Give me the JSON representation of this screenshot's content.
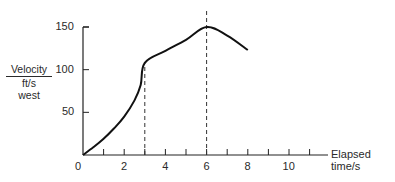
{
  "chart_data": {
    "type": "line",
    "title": "",
    "xlabel": "Elapsed time/s",
    "ylabel": [
      "Velocity",
      "ft/s",
      "west"
    ],
    "xlim": [
      0,
      11.5
    ],
    "ylim": [
      0,
      150
    ],
    "x_ticks": [
      "0",
      "2",
      "4",
      "6",
      "8",
      "10"
    ],
    "y_ticks": [
      "50",
      "100",
      "150"
    ],
    "grid": false,
    "legend": null,
    "series": [
      {
        "name": "Velocity",
        "x": [
          0,
          0.5,
          1,
          1.5,
          2,
          2.5,
          2.8,
          3,
          4,
          5,
          6,
          7,
          8
        ],
        "y": [
          0,
          9,
          19,
          31,
          45,
          64,
          82,
          108,
          122,
          135,
          150,
          140,
          123
        ]
      }
    ],
    "annotations": [
      {
        "type": "vline",
        "x": 3,
        "style": "dashed",
        "from_y": 0,
        "to_y": 108
      },
      {
        "type": "vline",
        "x": 6,
        "style": "dashed",
        "from_y": 0,
        "to_y": 160
      }
    ]
  }
}
